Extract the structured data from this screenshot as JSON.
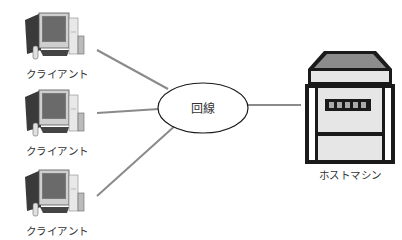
{
  "diagram": {
    "clients": [
      {
        "label": "クライアント"
      },
      {
        "label": "クライアント"
      },
      {
        "label": "クライアント"
      }
    ],
    "network": {
      "label": "回線"
    },
    "host": {
      "label": "ホストマシン"
    },
    "colors": {
      "line": "#8a8a8a",
      "outline": "#1a1a1a",
      "server_top": "#8c8c8c",
      "server_panel": "#e6e6e6",
      "text": "#333333"
    }
  }
}
